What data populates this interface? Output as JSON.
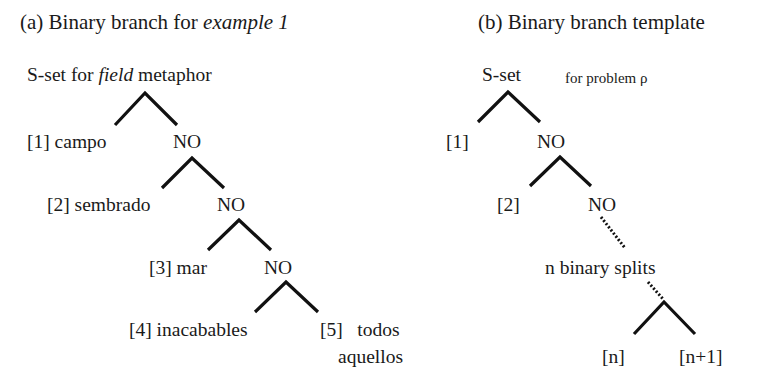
{
  "panel_a": {
    "title_prefix": "(a) Binary branch for ",
    "title_italic": "example 1",
    "root_prefix": "S-set for ",
    "root_italic": "field",
    "root_suffix": " metaphor",
    "nodes": [
      {
        "leaf": "[1] campo",
        "branch": "NO"
      },
      {
        "leaf": "[2] sembrado",
        "branch": "NO"
      },
      {
        "leaf": "[3] mar",
        "branch": "NO"
      },
      {
        "leaf": "[4] inacabables",
        "branch": "[5]   todos",
        "branch_line2": "aquellos"
      }
    ]
  },
  "panel_b": {
    "title": "(b) Binary branch template",
    "root": "S-set",
    "root_note": "for problem ρ",
    "nodes": [
      {
        "leaf": "[1]",
        "branch": "NO"
      },
      {
        "leaf": "[2]",
        "branch": "NO"
      }
    ],
    "ellipsis_label": "n binary splits",
    "final_left": "[n]",
    "final_right": "[n+1]"
  }
}
